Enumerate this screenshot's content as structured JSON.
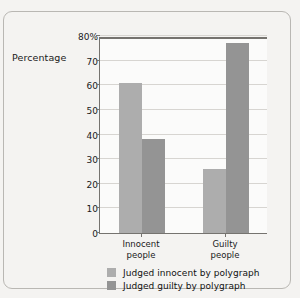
{
  "chart_data": {
    "type": "bar",
    "title": "",
    "xlabel": "",
    "ylabel": "Percentage",
    "ylim": [
      0,
      80
    ],
    "grid": true,
    "legend_position": "bottom",
    "categories": [
      "Innocent\npeople",
      "Guilty\npeople"
    ],
    "category_lines": [
      [
        "Innocent",
        "people"
      ],
      [
        "Guilty",
        "people"
      ]
    ],
    "y_ticks": [
      0,
      10,
      20,
      30,
      40,
      50,
      60,
      70,
      80
    ],
    "y_tick_labels": [
      "0",
      "10",
      "20",
      "30",
      "40",
      "50",
      "60",
      "70",
      "80%"
    ],
    "series": [
      {
        "name": "Judged innocent by polygraph",
        "color": "#adadad",
        "values": [
          61,
          26
        ]
      },
      {
        "name": "Judged guilty by polygraph",
        "color": "#949494",
        "values": [
          38,
          77
        ]
      }
    ]
  },
  "axis": {
    "y_title": "Percentage"
  },
  "colors": {
    "series_light": "#adadad",
    "series_dark": "#949494",
    "page_background": "#f4f3f1",
    "plot_background": "#fbfbfa",
    "gridline": "#d7d5d1",
    "axis_line": "#75736f",
    "card_border": "#b9b7b3",
    "text": "#1a1a1a"
  }
}
